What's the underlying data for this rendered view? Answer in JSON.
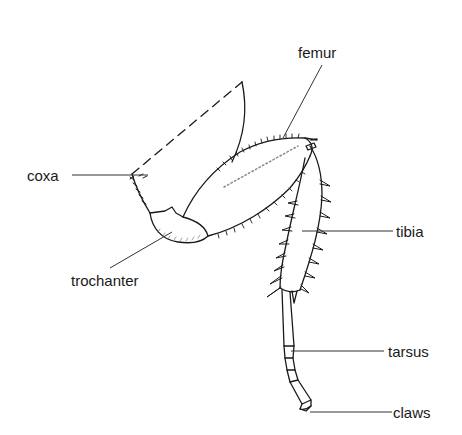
{
  "diagram": {
    "labels": [
      {
        "id": "femur",
        "text": "femur"
      },
      {
        "id": "coxa",
        "text": "coxa"
      },
      {
        "id": "tibia",
        "text": "tibia"
      },
      {
        "id": "trochanter",
        "text": "trochanter"
      },
      {
        "id": "tarsus",
        "text": "tarsus"
      },
      {
        "id": "claws",
        "text": "claws"
      }
    ],
    "colors": {
      "line": "#1a1a1a",
      "leader": "#333333",
      "background": "#ffffff"
    }
  }
}
